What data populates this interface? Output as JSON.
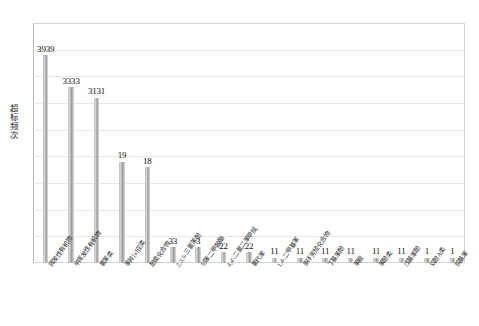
{
  "chart_data": {
    "type": "bar",
    "title": "",
    "subtitle": "",
    "xlabel": "",
    "ylabel": "超标频次",
    "ylim": [
      0,
      45
    ],
    "ytick_step": 5,
    "yticks": [
      "0",
      "5",
      "10",
      "15",
      "20",
      "25",
      "30",
      "35",
      "40",
      "45"
    ],
    "grid": true,
    "legend": false,
    "bar_color": "#a9a9a9",
    "categories": [
      "挥发性有机物",
      "半挥发性有机物",
      "氯苯类",
      "苯并[a]芘类",
      "酚类化合物",
      "2,3,5-三氯苯酚",
      "邻苯二甲酸酯",
      "4,4'-二氯二苯甲烷",
      "氯代苯",
      "1,4-二甲基苯",
      "多环芳烃化合物",
      "丁基苯酚",
      "苯胺",
      "苯酚类",
      "戊基苯酚",
      "双酚A类",
      "烷基苯"
    ],
    "values": [
      39,
      33,
      31,
      19,
      18,
      3,
      3,
      2,
      2,
      1,
      1,
      1,
      1,
      1,
      1,
      1,
      1
    ],
    "data_labels": [
      "3939",
      "3333",
      "3131",
      "19",
      "18",
      "33",
      "3",
      "22",
      "22",
      "11",
      "11",
      "11",
      "11",
      "11",
      "11",
      "11",
      "1",
      "1"
    ],
    "bar_labels": [
      "3939",
      "3333",
      "3131",
      "19",
      "18",
      "33",
      "3",
      "22",
      "22",
      "11",
      "11",
      "11",
      "11",
      "11",
      "11",
      "1",
      "1"
    ]
  }
}
